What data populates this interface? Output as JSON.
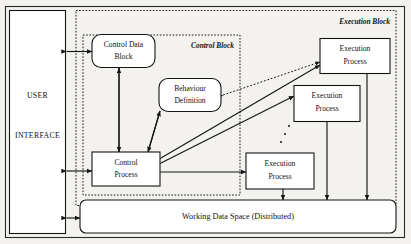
{
  "figure": {
    "background_color": "#f3f2ef",
    "frame_color": "#2a2a2a"
  },
  "user_interface": {
    "line1": "USER",
    "line2": "INTERFACE"
  },
  "regions": [
    {
      "id": "execution-block",
      "label": "Execution Block",
      "style": "dotted"
    },
    {
      "id": "control-block",
      "label": "Control Block",
      "style": "dotted"
    }
  ],
  "nodes": {
    "control_data_block": {
      "line1": "Control Data",
      "line2": "Block",
      "shape": "rounded"
    },
    "behaviour_definition": {
      "line1": "Behaviour",
      "line2": "Definition",
      "shape": "rounded"
    },
    "control_process": {
      "line1": "Control",
      "line2": "Process",
      "shape": "rectangle"
    },
    "execution_process_1": {
      "line1": "Execution",
      "line2": "Process",
      "shape": "rectangle"
    },
    "execution_process_2": {
      "line1": "Execution",
      "line2": "Process",
      "shape": "rectangle"
    },
    "execution_process_3": {
      "line1": "Execution",
      "line2": "Process",
      "shape": "rectangle"
    }
  },
  "working_data_space": {
    "label": "Working Data Space (Distributed)",
    "shape": "rounded"
  },
  "ellipsis": {
    "meaning": "more execution processes",
    "dot_count": 3
  },
  "connections": [
    {
      "id": "ui-to-control-data-block",
      "style": "solid",
      "arrows": "both"
    },
    {
      "id": "ui-to-control-process",
      "style": "solid",
      "arrows": "both"
    },
    {
      "id": "ui-to-working-data-space",
      "style": "solid",
      "arrows": "both"
    },
    {
      "id": "control-data-block-to-control-process",
      "style": "solid",
      "arrows": "end"
    },
    {
      "id": "behaviour-definition-to-control-process",
      "style": "solid",
      "arrows": "end"
    },
    {
      "id": "control-process-to-behaviour-definition",
      "style": "solid",
      "arrows": "end"
    },
    {
      "id": "control-process-to-control-data-block",
      "style": "solid",
      "arrows": "end"
    },
    {
      "id": "control-process-to-execution-process-1",
      "style": "solid",
      "arrows": "both"
    },
    {
      "id": "control-process-to-execution-process-2",
      "style": "solid",
      "arrows": "both"
    },
    {
      "id": "control-process-to-execution-process-3",
      "style": "solid",
      "arrows": "both"
    },
    {
      "id": "behaviour-definition-to-execution-process-1",
      "style": "dotted",
      "arrows": "both"
    },
    {
      "id": "execution-process-1-to-working-data-space",
      "style": "solid",
      "arrows": "both"
    },
    {
      "id": "execution-process-2-to-working-data-space",
      "style": "solid",
      "arrows": "both"
    },
    {
      "id": "execution-process-3-to-working-data-space",
      "style": "solid",
      "arrows": "both"
    }
  ]
}
